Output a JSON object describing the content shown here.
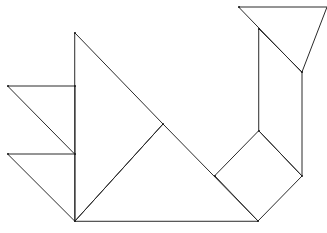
{
  "diagram": {
    "type": "tangram",
    "stroke_color": "#2a2a2a",
    "background": "#ffffff",
    "polygons": [
      {
        "name": "large-triangle-body",
        "points": [
          [
            75,
            33
          ],
          [
            163,
            124
          ],
          [
            75,
            221
          ]
        ]
      },
      {
        "name": "large-triangle-base",
        "points": [
          [
            75,
            221
          ],
          [
            163,
            124
          ],
          [
            258,
            221
          ]
        ]
      },
      {
        "name": "small-triangle-tail-upper",
        "points": [
          [
            8,
            86
          ],
          [
            75,
            86
          ],
          [
            75,
            154
          ]
        ]
      },
      {
        "name": "small-triangle-tail-lower",
        "points": [
          [
            8,
            154
          ],
          [
            75,
            154
          ],
          [
            75,
            221
          ]
        ]
      },
      {
        "name": "square",
        "points": [
          [
            259,
            131
          ],
          [
            302,
            176
          ],
          [
            258,
            221
          ],
          [
            215,
            176
          ]
        ]
      },
      {
        "name": "parallelogram-neck",
        "points": [
          [
            259,
            29
          ],
          [
            302,
            72
          ],
          [
            302,
            176
          ],
          [
            259,
            131
          ]
        ]
      },
      {
        "name": "medium-triangle-head",
        "points": [
          [
            239,
            7
          ],
          [
            327,
            7
          ],
          [
            302,
            72
          ]
        ]
      }
    ],
    "vertices": [
      [
        75,
        33
      ],
      [
        75,
        86
      ],
      [
        75,
        154
      ],
      [
        75,
        221
      ],
      [
        8,
        86
      ],
      [
        8,
        154
      ],
      [
        163,
        124
      ],
      [
        258,
        221
      ],
      [
        215,
        176
      ],
      [
        259,
        131
      ],
      [
        302,
        176
      ],
      [
        302,
        72
      ],
      [
        259,
        29
      ],
      [
        239,
        7
      ]
    ]
  }
}
